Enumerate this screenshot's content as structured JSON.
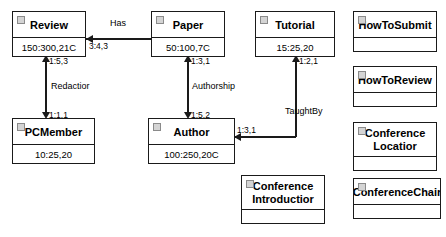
{
  "diagram": {
    "type": "uml-class-diagram",
    "stroke_color": "#1a1a1a",
    "background_color": "#ffffff",
    "marker_color": "#d4d4d4"
  },
  "classes": [
    {
      "id": "review",
      "name": "Review",
      "attributes": "150:300,21C",
      "has_attribute_compartment": true,
      "two_line_title": false
    },
    {
      "id": "paper",
      "name": "Paper",
      "attributes": "50:100,7C",
      "has_attribute_compartment": true,
      "two_line_title": false
    },
    {
      "id": "tutorial",
      "name": "Tutorial",
      "attributes": "15:25,20",
      "has_attribute_compartment": true,
      "two_line_title": false
    },
    {
      "id": "howtosubmit",
      "name": "HowToSubmit",
      "attributes": "",
      "has_attribute_compartment": true,
      "two_line_title": false
    },
    {
      "id": "howtoreview",
      "name": "HowToReview",
      "attributes": "",
      "has_attribute_compartment": true,
      "two_line_title": false
    },
    {
      "id": "conferencelocation",
      "name_line1": "Conference",
      "name_line2": "Locatior",
      "attributes": "",
      "has_attribute_compartment": true,
      "two_line_title": true
    },
    {
      "id": "pcmember",
      "name": "PCMember",
      "attributes": "10:25,20",
      "has_attribute_compartment": true,
      "two_line_title": false
    },
    {
      "id": "author",
      "name": "Author",
      "attributes": "100:250,20C",
      "has_attribute_compartment": true,
      "two_line_title": false
    },
    {
      "id": "conferenceintroduction",
      "name_line1": "Conference",
      "name_line2": "Introductior",
      "attributes": "",
      "has_attribute_compartment": true,
      "two_line_title": true
    },
    {
      "id": "conferencechair",
      "name": "ConferenceChair",
      "attributes": "",
      "has_attribute_compartment": true,
      "two_line_title": false
    }
  ],
  "associations": [
    {
      "id": "has",
      "label": "Has",
      "from": "review",
      "to": "paper",
      "multiplicity_source": "3:4,3",
      "multiplicity_target": ""
    },
    {
      "id": "redaction",
      "label": "Redactior",
      "from": "pcmember",
      "to": "review",
      "multiplicity_source": "1:1,1",
      "multiplicity_target": "1:5,3"
    },
    {
      "id": "authorship",
      "label": "Authorship",
      "from": "author",
      "to": "paper",
      "multiplicity_source": "1:5,2",
      "multiplicity_target": "1:3,1"
    },
    {
      "id": "taughtby",
      "label": "TaughtBy",
      "from": "author",
      "to": "tutorial",
      "multiplicity_source": "1:3,1",
      "multiplicity_target": "1:2,1"
    }
  ]
}
